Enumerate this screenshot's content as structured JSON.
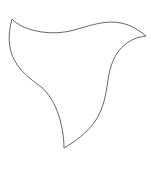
{
  "canvas": {
    "width": 151,
    "height": 172,
    "background": "#ffffff"
  },
  "shape": {
    "name": "curved-triangle",
    "stroke": "#555555",
    "stroke_width": 0.9,
    "fill": "none",
    "path": "M12,19 C22,30 48,36 70,31 C95,25 118,12 146,36 C128,38 112,50 108,80 C104,110 98,128 64,148 C64,130 58,100 40,86 C20,72 2,55 12,19 Z"
  }
}
